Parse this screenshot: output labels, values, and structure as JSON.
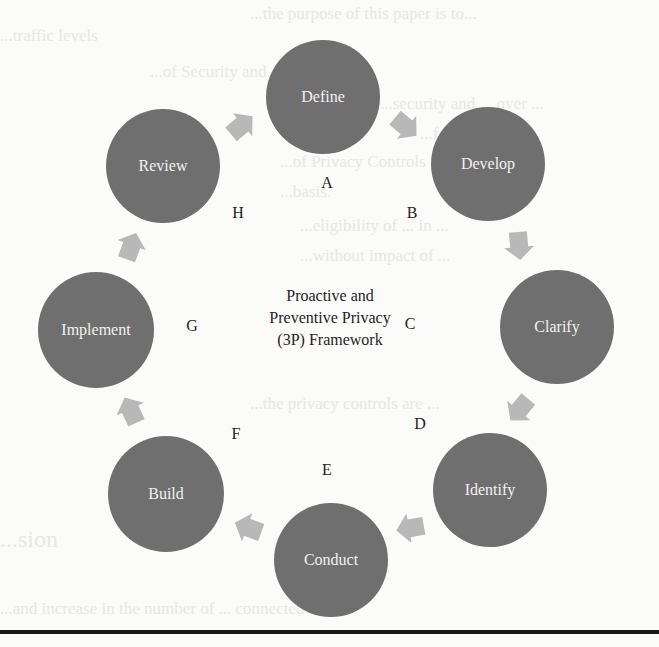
{
  "figure": {
    "center_title_lines": [
      "Proactive and",
      "Preventive Privacy",
      "(3P) Framework"
    ],
    "node_color": "#6f6f6f",
    "arrow_color": "#b8b8b8",
    "node_text_color": "#f2f2f0",
    "steps": [
      {
        "letter": "A",
        "label": "Define"
      },
      {
        "letter": "B",
        "label": "Develop"
      },
      {
        "letter": "C",
        "label": "Clarify"
      },
      {
        "letter": "D",
        "label": "Identify"
      },
      {
        "letter": "E",
        "label": "Conduct"
      },
      {
        "letter": "F",
        "label": "Build"
      },
      {
        "letter": "G",
        "label": "Implement"
      },
      {
        "letter": "H",
        "label": "Review"
      }
    ]
  },
  "background_bleed": {
    "lines": [
      "...the purpose of this paper is to...",
      "...traffic levels",
      "...of Security and ... Controls",
      "...security and ... over ...",
      "...for a period ...",
      "...of Privacy Controls ... Dev...",
      "...basis.",
      "...eligibility of ... in ...",
      "...without impact of ...",
      "...the privacy controls are ...",
      "...sion",
      "...and increase in the number of ... connected to"
    ]
  }
}
